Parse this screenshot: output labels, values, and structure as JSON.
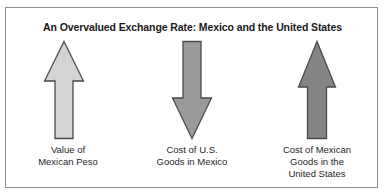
{
  "figure": {
    "title": "An Overvalued Exchange Rate: Mexico and the United States",
    "background_color": "#ffffff",
    "border_color": "#8d8d8d",
    "outline_color": "#4a4a4a"
  },
  "items": [
    {
      "arrow_icon": "arrow-up-icon",
      "direction": "up",
      "fill_color": "#d4d4d4",
      "label_lines": [
        "Value of",
        "Mexican Peso"
      ]
    },
    {
      "arrow_icon": "arrow-down-icon",
      "direction": "down",
      "fill_color": "#9a9a9a",
      "label_lines": [
        "Cost of U.S.",
        "Goods in Mexico"
      ]
    },
    {
      "arrow_icon": "arrow-up-icon",
      "direction": "up",
      "fill_color": "#858585",
      "label_lines": [
        "Cost of Mexican",
        "Goods in the",
        "United States"
      ]
    }
  ]
}
